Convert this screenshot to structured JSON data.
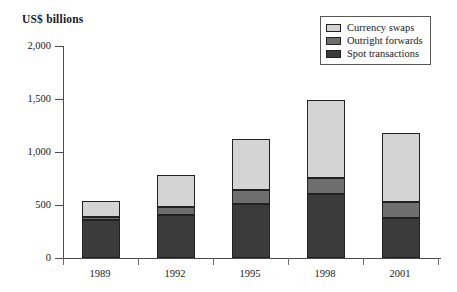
{
  "chart_data": {
    "type": "bar",
    "subtype": "stacked-bar",
    "title": "US$ billions",
    "xlabel": "",
    "ylabel": "US$ billions",
    "categories": [
      "1989",
      "1992",
      "1995",
      "1998",
      "2001"
    ],
    "ylim": [
      0,
      2000
    ],
    "yticks": [
      0,
      500,
      1000,
      1500,
      2000
    ],
    "ytick_labels": [
      "0",
      "500",
      "1,000",
      "1,500",
      "2,000"
    ],
    "grid": false,
    "legend_position": "top-right",
    "stack_order_bottom_to_top": [
      "Spot transactions",
      "Outright forwards",
      "Currency swaps"
    ],
    "series": [
      {
        "name": "Spot transactions",
        "color": "#3b3b3b",
        "values": [
          355,
          410,
          510,
          600,
          380
        ]
      },
      {
        "name": "Outright forwards",
        "color": "#6e6e6e",
        "values": [
          35,
          75,
          130,
          155,
          150
        ]
      },
      {
        "name": "Currency swaps",
        "color": "#d4d4d4",
        "values": [
          150,
          295,
          480,
          735,
          650
        ]
      }
    ],
    "totals": [
      540,
      780,
      1120,
      1490,
      1180
    ]
  },
  "legend": {
    "items": [
      {
        "label": "Currency swaps",
        "color": "#d4d4d4"
      },
      {
        "label": "Outright forwards",
        "color": "#6e6e6e"
      },
      {
        "label": "Spot transactions",
        "color": "#3b3b3b"
      }
    ]
  },
  "axis": {
    "y_labels": [
      "2,000",
      "1,500",
      "1,000",
      "500",
      "0"
    ],
    "x_labels": [
      "1989",
      "1992",
      "1995",
      "1998",
      "2001"
    ]
  }
}
